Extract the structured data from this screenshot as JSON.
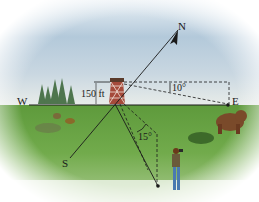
{
  "figure": {
    "type": "bearing-and-angle-of-depression diagram",
    "directions": {
      "north": "N",
      "south": "S",
      "east": "E",
      "west": "W"
    },
    "tower_height_label": "150 ft",
    "angle_depression_label": "10°",
    "angle_bearing_label": "15°",
    "colors": {
      "sky_top": "#c9dbe9",
      "sky_mid": "#9cb7cd",
      "horizon_haze": "#e6ecef",
      "grass": "#6ea84a",
      "grass_dark": "#4f8a34",
      "line": "#1a1a1a",
      "tower": "#8a3a2a",
      "bear": "#7a4a2a"
    },
    "objects": [
      "fire-tower",
      "bear",
      "hiker",
      "trees",
      "bushes"
    ]
  }
}
